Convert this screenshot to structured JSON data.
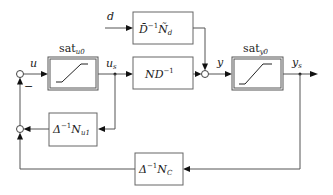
{
  "diagram": {
    "type": "control-block-diagram",
    "signals": {
      "u": "u",
      "us": "u",
      "us_sub": "s",
      "d": "d",
      "y": "y",
      "ys": "y",
      "ys_sub": "s",
      "minus": "−"
    },
    "blocks": {
      "sat_u": {
        "label": "sat",
        "sub": "u0",
        "kind": "saturation"
      },
      "sat_y": {
        "label": "sat",
        "sub": "y0",
        "kind": "saturation"
      },
      "disturbance": {
        "main": "D̄",
        "sup": "−1",
        "main2": "Ñ",
        "sub": "d"
      },
      "plant": {
        "main": "ND",
        "sup": "−1"
      },
      "feedback_u": {
        "main": "Δ",
        "sub1": "1",
        "sup": "−1",
        "main2": "N",
        "sub": "u1"
      },
      "feedback_c": {
        "main": "Δ",
        "sub1": "1",
        "sup": "−1",
        "main2": "N",
        "sub": "C"
      }
    },
    "connections": [
      "sum_left -> sat_u (u)",
      "sat_u -> plant (u_s)",
      "u_s -> feedback_u",
      "feedback_u -> sum_lower",
      "d -> disturbance",
      "disturbance -> sum_right",
      "plant -> sum_right",
      "sum_right -> sat_y (y)",
      "sat_y -> output (y_s)",
      "y_s -> feedback_c",
      "feedback_c -> sum_lower",
      "sum_lower -> sum_left (−)"
    ]
  }
}
